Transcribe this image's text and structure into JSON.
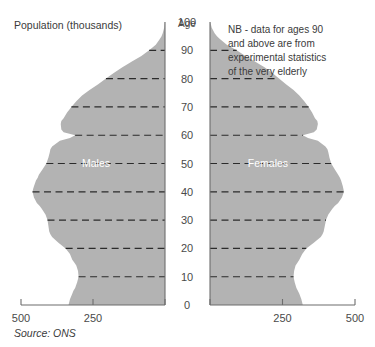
{
  "titles": {
    "left_axis_title": "Population (thousands)",
    "age_axis_title": "Age",
    "note": "NB - data for ages 90 and above are from experimental statistics of the very elderly",
    "note_lines": [
      "NB - data for ages 90",
      "and above are from",
      "experimental statistics",
      "of the very elderly"
    ],
    "source": "Source: ONS"
  },
  "series_labels": {
    "males": "Males",
    "females": "Females"
  },
  "colors": {
    "fill": "#b3b3b3",
    "gridline": "#2b2b2b",
    "axis": "#6d6d6d",
    "text": "#3b3b3b",
    "series_label": "#ffffff",
    "background": "#ffffff"
  },
  "axis": {
    "x_left_ticks": [
      "500",
      "250"
    ],
    "x_right_ticks": [
      "250",
      "500"
    ],
    "x_zero": "0",
    "x_unit": "thousands",
    "x_max": 500,
    "y_ticks": [
      "0",
      "10",
      "20",
      "30",
      "40",
      "50",
      "60",
      "70",
      "80",
      "90",
      "100"
    ],
    "y_min": 0,
    "y_max": 100,
    "gridline_ages": [
      10,
      20,
      30,
      40,
      50,
      60,
      70,
      80,
      90
    ]
  },
  "chart_data": {
    "type": "area",
    "title": "Population (thousands)",
    "subtitle": "",
    "xlabel": "Population (thousands)",
    "ylabel": "Age",
    "xlim": [
      -500,
      500
    ],
    "ylim": [
      0,
      100
    ],
    "grid": true,
    "legend": "inline",
    "annotations": [
      "NB - data for ages 90 and above are from experimental statistics of the very elderly",
      "Source: ONS"
    ],
    "x": [
      0,
      2,
      4,
      5,
      6,
      8,
      10,
      12,
      14,
      15,
      16,
      18,
      20,
      22,
      24,
      25,
      26,
      28,
      30,
      32,
      34,
      35,
      36,
      38,
      40,
      41,
      42,
      44,
      45,
      46,
      48,
      50,
      52,
      54,
      55,
      56,
      58,
      59,
      60,
      61,
      62,
      64,
      65,
      66,
      68,
      70,
      72,
      74,
      75,
      76,
      78,
      80,
      82,
      84,
      85,
      86,
      88,
      90,
      92,
      94,
      95,
      96,
      98,
      100
    ],
    "series": [
      {
        "name": "Males",
        "side": "left",
        "values": [
          335,
          330,
          322,
          318,
          312,
          305,
          300,
          302,
          308,
          315,
          322,
          330,
          345,
          370,
          392,
          398,
          402,
          405,
          408,
          415,
          428,
          435,
          445,
          455,
          460,
          458,
          455,
          448,
          442,
          438,
          425,
          412,
          405,
          400,
          398,
          392,
          365,
          330,
          312,
          352,
          360,
          362,
          360,
          352,
          340,
          325,
          308,
          288,
          275,
          262,
          232,
          205,
          178,
          148,
          132,
          115,
          82,
          55,
          32,
          18,
          12,
          8,
          3,
          1
        ]
      },
      {
        "name": "Females",
        "side": "right",
        "values": [
          320,
          315,
          308,
          303,
          298,
          292,
          288,
          290,
          295,
          302,
          308,
          318,
          332,
          358,
          382,
          388,
          392,
          396,
          400,
          408,
          422,
          430,
          442,
          455,
          462,
          460,
          458,
          452,
          448,
          442,
          430,
          418,
          412,
          408,
          405,
          398,
          372,
          338,
          320,
          358,
          368,
          372,
          370,
          362,
          352,
          340,
          325,
          308,
          298,
          288,
          262,
          238,
          215,
          188,
          172,
          155,
          122,
          92,
          58,
          34,
          24,
          16,
          6,
          1
        ]
      }
    ]
  }
}
